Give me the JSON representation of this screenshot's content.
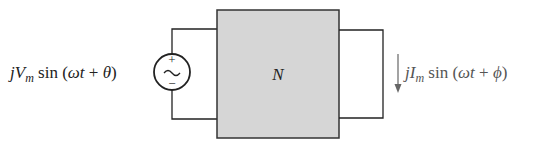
{
  "diagram": {
    "type": "circuit",
    "network": {
      "label": "N",
      "fill": "#d6d6d6",
      "stroke": "#333333"
    },
    "source": {
      "kind": "ac-voltage-source",
      "plus": "+",
      "minus": "−",
      "symbol": "~",
      "label": {
        "j": "j",
        "V": "V",
        "sub": "m",
        "func": " sin (",
        "omega": "ω",
        "t": "t",
        "plus": " + ",
        "phase": "θ",
        "close": ")"
      }
    },
    "output_current": {
      "kind": "current-arrow",
      "direction": "down",
      "label": {
        "j": "j",
        "I": "I",
        "sub": "m",
        "func": " sin (",
        "omega": "ω",
        "t": "t",
        "plus": " + ",
        "phase": "ϕ",
        "close": ")"
      },
      "color": "#555555"
    }
  }
}
